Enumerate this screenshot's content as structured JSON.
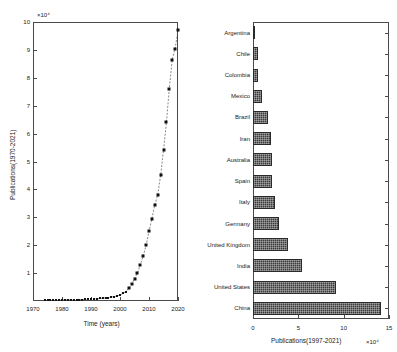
{
  "chart_data": [
    {
      "id": "publications-over-time",
      "type": "line",
      "title": "",
      "xlabel": "Time (years)",
      "ylabel": "Publications(1970-2021)",
      "y_exponent": "×10⁴",
      "xlim": [
        1970,
        2020
      ],
      "ylim": [
        0,
        10
      ],
      "xticks": [
        1970,
        1980,
        1990,
        2000,
        2010,
        2020
      ],
      "yticks": [
        1,
        2,
        3,
        4,
        5,
        6,
        7,
        8,
        9,
        10
      ],
      "grid": false,
      "legend": "none",
      "marker": "filled-square",
      "linestyle": "dashed",
      "x": [
        1974,
        1975,
        1976,
        1977,
        1978,
        1979,
        1980,
        1981,
        1982,
        1983,
        1984,
        1985,
        1986,
        1987,
        1988,
        1989,
        1990,
        1991,
        1992,
        1993,
        1994,
        1995,
        1996,
        1997,
        1998,
        1999,
        2000,
        2001,
        2002,
        2003,
        2004,
        2005,
        2006,
        2007,
        2008,
        2009,
        2010,
        2011,
        2012,
        2013,
        2014,
        2015,
        2016,
        2017,
        2018,
        2019,
        2020
      ],
      "y": [
        0.02,
        0.02,
        0.02,
        0.02,
        0.03,
        0.03,
        0.03,
        0.03,
        0.04,
        0.04,
        0.04,
        0.05,
        0.05,
        0.05,
        0.06,
        0.06,
        0.07,
        0.07,
        0.08,
        0.09,
        0.1,
        0.11,
        0.12,
        0.14,
        0.16,
        0.18,
        0.22,
        0.27,
        0.34,
        0.45,
        0.6,
        0.8,
        1.0,
        1.3,
        1.6,
        2.0,
        2.5,
        2.95,
        3.45,
        3.8,
        4.5,
        5.4,
        6.4,
        7.6,
        8.65,
        9.05,
        9.7
      ]
    },
    {
      "id": "publications-by-country",
      "type": "bar",
      "orientation": "horizontal",
      "title": "",
      "xlabel": "Publications(1997-2021)",
      "ylabel": "",
      "x_exponent": "×10⁴",
      "xlim": [
        0,
        15
      ],
      "xticks": [
        0,
        5,
        10,
        15
      ],
      "grid": false,
      "legend": "none",
      "categories": [
        "Argentina",
        "Chile",
        "Colombia",
        "Mexico",
        "Brazil",
        "Iran",
        "Australia",
        "Spain",
        "Italy",
        "Germany",
        "United Kingdom",
        "India",
        "United States",
        "China"
      ],
      "values": [
        0.25,
        0.5,
        0.5,
        1.0,
        1.6,
        2.0,
        2.05,
        2.15,
        2.4,
        2.9,
        3.85,
        5.35,
        9.1,
        14.1
      ]
    }
  ]
}
